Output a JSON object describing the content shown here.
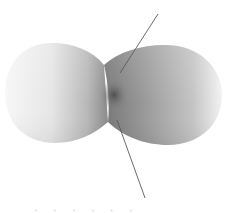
{
  "figure": {
    "colors": {
      "background": "#ffffff",
      "lobe_light": "#f4f4f4",
      "lobe_mid": "#b4b4b4",
      "lobe_dark": "#6e6e6e",
      "center_spot": "#4a4a4a",
      "axis_line": "#5a5a5a"
    },
    "left_lobe": {
      "cx": 57,
      "cy": 93,
      "rx": 54,
      "ry": 50
    },
    "right_lobe": {
      "cx": 165,
      "cy": 95,
      "rx": 57,
      "ry": 50
    },
    "axis_upper": {
      "x1": 158,
      "y1": 14,
      "x2": 120,
      "y2": 73
    },
    "axis_lower": {
      "x1": 117,
      "y1": 120,
      "x2": 145,
      "y2": 198
    }
  },
  "caption": {
    "text": "· ·  ·   ·  ·     ·"
  }
}
